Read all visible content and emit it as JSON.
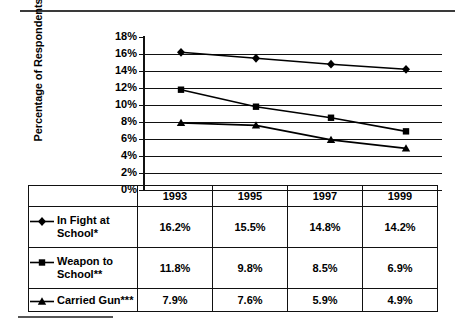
{
  "chart_data": {
    "type": "line",
    "title": "",
    "xlabel": "",
    "ylabel": "Percentage of Respondents",
    "categories": [
      "1993",
      "1995",
      "1997",
      "1999"
    ],
    "ylim": [
      0,
      18
    ],
    "ytick_labels": [
      "18%",
      "16%",
      "14%",
      "12%",
      "10%",
      "8%",
      "6%",
      "4%",
      "2%",
      "0%"
    ],
    "ytick_values": [
      18,
      16,
      14,
      12,
      10,
      8,
      6,
      4,
      2,
      0
    ],
    "grid": "horizontal",
    "legend_position": "table-below",
    "series": [
      {
        "name": "In Fight at School*",
        "marker": "diamond",
        "values": [
          16.2,
          15.5,
          14.8,
          14.2
        ],
        "labels": [
          "16.2%",
          "15.5%",
          "14.8%",
          "14.2%"
        ]
      },
      {
        "name": "Weapon to School**",
        "marker": "square",
        "values": [
          11.8,
          9.8,
          8.5,
          6.9
        ],
        "labels": [
          "11.8%",
          "9.8%",
          "8.5%",
          "6.9%"
        ]
      },
      {
        "name": "Carried Gun***",
        "marker": "triangle",
        "values": [
          7.9,
          7.6,
          5.9,
          4.9
        ],
        "labels": [
          "7.9%",
          "7.6%",
          "5.9%",
          "4.9%"
        ]
      }
    ],
    "color": "#000000"
  },
  "axis": {
    "ylabel": "Percentage of Respondents",
    "ticks": [
      "18%",
      "16%",
      "14%",
      "12%",
      "10%",
      "8%",
      "6%",
      "4%",
      "2%",
      "0%"
    ]
  },
  "table": {
    "year_headers": [
      "1993",
      "1995",
      "1997",
      "1999"
    ],
    "rows": [
      {
        "legend_line1": "In Fight at",
        "legend_line2": "School*",
        "marker": "diamond-icon",
        "values": [
          "16.2%",
          "15.5%",
          "14.8%",
          "14.2%"
        ]
      },
      {
        "legend_line1": "Weapon to",
        "legend_line2": "School**",
        "marker": "square-icon",
        "values": [
          "11.8%",
          "9.8%",
          "8.5%",
          "6.9%"
        ]
      },
      {
        "legend_line1": "Carried Gun***",
        "legend_line2": "",
        "marker": "triangle-icon",
        "values": [
          "7.9%",
          "7.6%",
          "5.9%",
          "4.9%"
        ]
      }
    ]
  }
}
